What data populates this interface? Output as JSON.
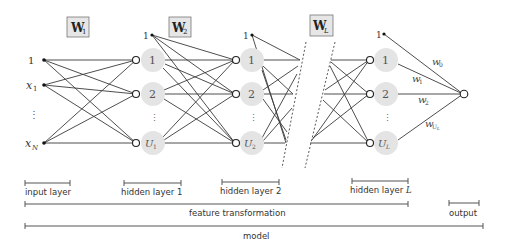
{
  "diagram": {
    "type": "neural-network",
    "weights": [
      {
        "id": "W1",
        "label": "W",
        "sub": "1"
      },
      {
        "id": "W2",
        "label": "W",
        "sub": "2"
      },
      {
        "id": "WL",
        "label": "W",
        "sub": "L"
      }
    ],
    "input_layer": {
      "nodes": [
        "1",
        "x",
        "⋮",
        "x"
      ],
      "node_subs": [
        "",
        "1",
        "",
        "N"
      ]
    },
    "hidden_layer_1": {
      "bias": "1",
      "nodes": [
        "1",
        "2",
        "⋮",
        "U"
      ],
      "last_sub": "1"
    },
    "hidden_layer_2": {
      "bias": "1",
      "nodes": [
        "1",
        "2",
        "⋮",
        "U"
      ],
      "last_sub": "2"
    },
    "hidden_layer_L": {
      "bias": "1",
      "nodes": [
        "1",
        "2",
        "⋮",
        "U"
      ],
      "last_sub": "L"
    },
    "output_weights": [
      {
        "label": "w",
        "sub": "0"
      },
      {
        "label": "w",
        "sub": "1"
      },
      {
        "label": "w",
        "sub": "2"
      },
      {
        "label": "w",
        "sub": "U",
        "subsub": "L"
      }
    ],
    "brackets": {
      "input_layer": "input layer",
      "hidden_layer_1": "hidden layer 1",
      "hidden_layer_2": "hidden layer 2",
      "hidden_layer_L_prefix": "hidden layer ",
      "hidden_layer_L_var": "L",
      "feature_transformation": "feature transformation",
      "output": "output",
      "model": "model"
    }
  }
}
